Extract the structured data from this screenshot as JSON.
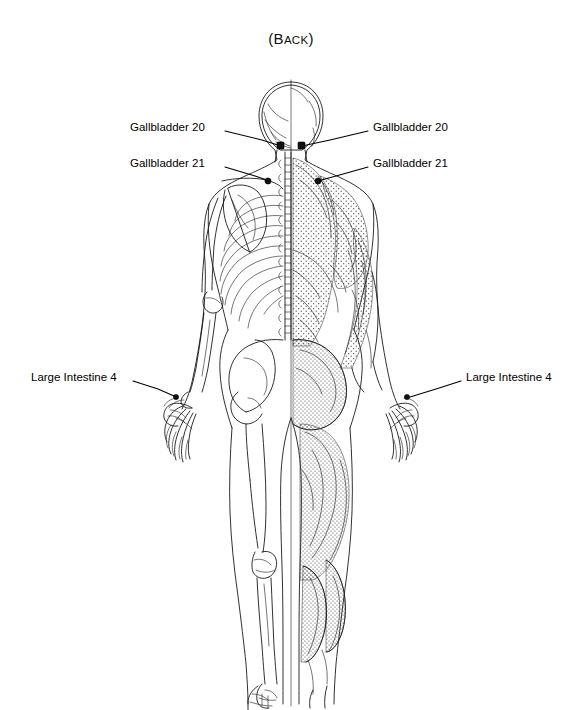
{
  "title": {
    "prefix": "(",
    "first_letter": "B",
    "rest": "ACK",
    "suffix": ")",
    "full_text": "(BACK)"
  },
  "colors": {
    "background": "#ffffff",
    "ink": "#1a1a1a",
    "text": "#000000",
    "stipple": "#3a3a3a"
  },
  "figure": {
    "view": "posterior",
    "left_half": "skeleton",
    "right_half": "muscles"
  },
  "annotations": [
    {
      "id": "gb20-left",
      "label": "Gallbladder 20",
      "side": "left",
      "label_x": 130,
      "label_y": 127,
      "point_x": 281,
      "point_y": 146
    },
    {
      "id": "gb21-left",
      "label": "Gallbladder 21",
      "side": "left",
      "label_x": 130,
      "label_y": 163,
      "point_x": 262,
      "point_y": 180
    },
    {
      "id": "gb20-right",
      "label": "Gallbladder 20",
      "side": "right",
      "label_x": 373,
      "label_y": 127,
      "point_x": 299,
      "point_y": 146
    },
    {
      "id": "gb21-right",
      "label": "Gallbladder 21",
      "side": "right",
      "label_x": 373,
      "label_y": 163,
      "point_x": 318,
      "point_y": 180
    },
    {
      "id": "li4-left",
      "label": "Large Intestine 4",
      "side": "left",
      "label_x": 31,
      "label_y": 377,
      "point_x": 170,
      "point_y": 395
    },
    {
      "id": "li4-right",
      "label": "Large Intestine 4",
      "side": "right",
      "label_x": 466,
      "label_y": 377,
      "point_x": 408,
      "point_y": 396
    }
  ],
  "acupoints": [
    {
      "name": "Gallbladder 20",
      "code": "GB-20",
      "location": "base of skull, occiput",
      "count": 2
    },
    {
      "name": "Gallbladder 21",
      "code": "GB-21",
      "location": "top of shoulder, trapezius",
      "count": 2
    },
    {
      "name": "Large Intestine 4",
      "code": "LI-4",
      "location": "hand, first dorsal interosseous",
      "count": 2
    }
  ]
}
